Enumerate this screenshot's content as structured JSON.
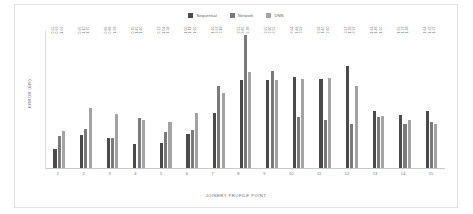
{
  "chart_data": {
    "type": "bar",
    "title": "",
    "xlabel": "JOINERY PROFILE POINT",
    "ylabel": "ERROR (MS)",
    "categories": [
      "1",
      "2",
      "3",
      "4",
      "5",
      "6",
      "7",
      "8",
      "9",
      "10",
      "11",
      "12",
      "13",
      "14",
      "15"
    ],
    "ylim": [
      0,
      4.0
    ],
    "grid": false,
    "legend_position": "top-center",
    "series": [
      {
        "name": "Sequential",
        "color": "#4a4a4a",
        "values": [
          0.55,
          0.95,
          0.86,
          0.7,
          0.72,
          1.0,
          1.6,
          2.55,
          2.55,
          2.64,
          2.58,
          2.97,
          1.64,
          1.55,
          1.64
        ],
        "labels": [
          "0.55",
          "0.95",
          "0.86",
          "0.70",
          "0.72",
          "1.00",
          "1.60",
          "2.55",
          "2.55",
          "2.64",
          "2.58",
          "2.97",
          "1.64",
          "1.55",
          "1.64"
        ]
      },
      {
        "name": "Network",
        "color": "#7a7a7a",
        "values": [
          0.92,
          1.12,
          0.88,
          1.45,
          1.04,
          1.11,
          2.37,
          3.85,
          2.8,
          1.48,
          1.4,
          1.28,
          1.48,
          1.27,
          1.32
        ],
        "labels": [
          "0.92",
          "1.12",
          "0.88",
          "1.45",
          "1.04",
          "1.11",
          "2.37",
          "3.85",
          "2.80",
          "1.48",
          "1.40",
          "1.28",
          "1.48",
          "1.27",
          "1.32"
        ]
      },
      {
        "name": "DNN",
        "color": "#a3a3a3",
        "values": [
          1.06,
          1.75,
          1.58,
          1.4,
          1.34,
          1.6,
          2.18,
          2.78,
          2.55,
          2.59,
          2.6,
          2.37,
          1.5,
          1.38,
          1.27
        ],
        "labels": [
          "1.06",
          "1.75",
          "1.58",
          "1.40",
          "1.34",
          "1.60",
          "2.18",
          "2.78",
          "2.55",
          "2.59",
          "2.60",
          "2.37",
          "1.50",
          "1.38",
          "1.27"
        ]
      }
    ]
  }
}
